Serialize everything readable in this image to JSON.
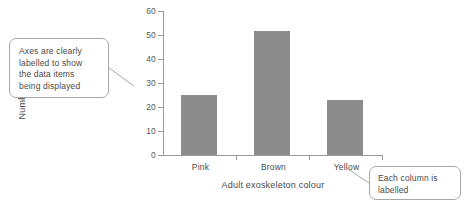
{
  "chart_data": {
    "type": "bar",
    "title": "",
    "categories": [
      "Pink",
      "Brown",
      "Yellow"
    ],
    "values": [
      25,
      52,
      23
    ],
    "series": [
      {
        "name": "Number of locusts",
        "values": [
          25,
          52,
          23
        ]
      }
    ],
    "xlabel": "Adult exoskeleton colour",
    "ylabel": "Number of locusts",
    "ylim": [
      0,
      60
    ],
    "ytick_step": 10,
    "yticks": [
      "0",
      "10",
      "20",
      "30",
      "40",
      "50",
      "60"
    ],
    "grid": false,
    "legend": false,
    "bar_color": "#8c8c8c",
    "axis_color": "#9a9a9a"
  },
  "annotations": [
    {
      "id": "axes-note",
      "text": "Axes are clearly\nlabelled to show\nthe data items\nbeing displayed"
    },
    {
      "id": "column-note",
      "text": "Each column is\nlabelled"
    }
  ],
  "colors": {
    "bar": "#8c8c8c",
    "axis": "#9a9a9a",
    "text": "#4a4a4a",
    "callout_border": "#a8a8a8",
    "background": "#ffffff"
  }
}
